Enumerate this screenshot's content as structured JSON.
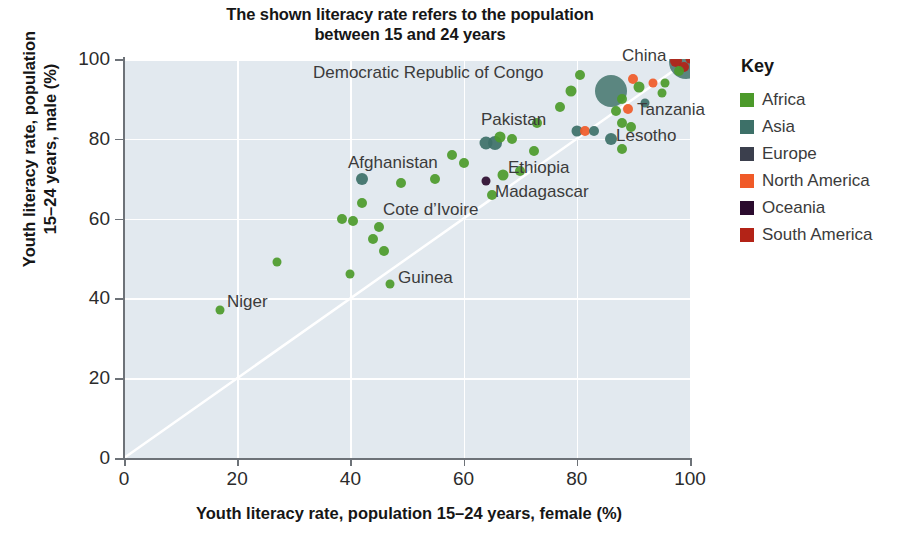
{
  "title": {
    "line1": "The shown literacy rate refers to the population",
    "line2": "between 15 and 24 years"
  },
  "axes": {
    "y_title_line1": "Youth literacy rate, population",
    "y_title_line2": "15–24 years, male (%)",
    "x_title": "Youth literacy rate, population 15–24 years, female (%)",
    "x_ticks": [
      "0",
      "20",
      "40",
      "60",
      "80",
      "100"
    ],
    "y_ticks": [
      "0",
      "20",
      "40",
      "60",
      "80",
      "100"
    ]
  },
  "legend": {
    "title": "Key",
    "items": [
      {
        "label": "Africa",
        "color": "#4c9a2a"
      },
      {
        "label": "Asia",
        "color": "#3d7068"
      },
      {
        "label": "Europe",
        "color": "#3b3f4d"
      },
      {
        "label": "North America",
        "color": "#f05a28"
      },
      {
        "label": "Oceania",
        "color": "#2b0b2e"
      },
      {
        "label": "South America",
        "color": "#b32317"
      }
    ]
  },
  "annotations": [
    {
      "text": "Democratic Republic of Congo",
      "x": 313,
      "y": 63
    },
    {
      "text": "China",
      "x": 622,
      "y": 46
    },
    {
      "text": "Tanzania",
      "x": 637,
      "y": 100
    },
    {
      "text": "Lesotho",
      "x": 616,
      "y": 126
    },
    {
      "text": "Pakistan",
      "x": 481,
      "y": 110
    },
    {
      "text": "Afghanistan",
      "x": 348,
      "y": 153
    },
    {
      "text": "Ethiopia",
      "x": 508,
      "y": 158
    },
    {
      "text": "Madagascar",
      "x": 495,
      "y": 182
    },
    {
      "text": "Cote d’Ivoire",
      "x": 383,
      "y": 200
    },
    {
      "text": "Guinea",
      "x": 398,
      "y": 268
    },
    {
      "text": "Niger",
      "x": 227,
      "y": 292
    }
  ],
  "chart_data": {
    "type": "scatter",
    "title": "The shown literacy rate refers to the population between 15 and 24 years",
    "xlabel": "Youth literacy rate, population 15–24 years, female (%)",
    "ylabel": "Youth literacy rate, population 15–24 years, male (%)",
    "xlim": [
      0,
      100
    ],
    "ylim": [
      0,
      100
    ],
    "xticks": [
      0,
      20,
      40,
      60,
      80,
      100
    ],
    "yticks": [
      0,
      20,
      40,
      60,
      80,
      100
    ],
    "grid": true,
    "legend_position": "right",
    "reference_line": {
      "type": "identity",
      "label": "y = x",
      "color": "#ffffff"
    },
    "size_encoding": "population",
    "series": [
      {
        "name": "Africa",
        "color": "#4c9a2a"
      },
      {
        "name": "Asia",
        "color": "#3d7068"
      },
      {
        "name": "Europe",
        "color": "#3b3f4d"
      },
      {
        "name": "North America",
        "color": "#f05a28"
      },
      {
        "name": "Oceania",
        "color": "#2b0b2e"
      },
      {
        "name": "South America",
        "color": "#b32317"
      }
    ],
    "points": [
      {
        "label": "Niger",
        "x": 17,
        "y": 37,
        "region": "Africa",
        "r": 4.5
      },
      {
        "label": "",
        "x": 27,
        "y": 49,
        "region": "Africa",
        "r": 4.5
      },
      {
        "label": "Guinea",
        "x": 47,
        "y": 43.5,
        "region": "Africa",
        "r": 4.5
      },
      {
        "label": "",
        "x": 40,
        "y": 46,
        "region": "Africa",
        "r": 4.5
      },
      {
        "label": "",
        "x": 46,
        "y": 52,
        "region": "Africa",
        "r": 5
      },
      {
        "label": "",
        "x": 44,
        "y": 55,
        "region": "Africa",
        "r": 5
      },
      {
        "label": "",
        "x": 38.5,
        "y": 60,
        "region": "Africa",
        "r": 5
      },
      {
        "label": "",
        "x": 40.5,
        "y": 59.5,
        "region": "Africa",
        "r": 5
      },
      {
        "label": "Cote d’Ivoire",
        "x": 45,
        "y": 58,
        "region": "Africa",
        "r": 5
      },
      {
        "label": "",
        "x": 42,
        "y": 64,
        "region": "Africa",
        "r": 5
      },
      {
        "label": "Afghanistan",
        "x": 42,
        "y": 70,
        "region": "Asia",
        "r": 6
      },
      {
        "label": "",
        "x": 49,
        "y": 69,
        "region": "Africa",
        "r": 5
      },
      {
        "label": "",
        "x": 55,
        "y": 70,
        "region": "Africa",
        "r": 5
      },
      {
        "label": "",
        "x": 58,
        "y": 76,
        "region": "Africa",
        "r": 5
      },
      {
        "label": "",
        "x": 60,
        "y": 74,
        "region": "Africa",
        "r": 5
      },
      {
        "label": "Papua New Guinea",
        "x": 64,
        "y": 69.5,
        "region": "Oceania",
        "r": 4.5
      },
      {
        "label": "Madagascar",
        "x": 65,
        "y": 66,
        "region": "Africa",
        "r": 5
      },
      {
        "label": "Ethiopia",
        "x": 67,
        "y": 71,
        "region": "Africa",
        "r": 5.5
      },
      {
        "label": "",
        "x": 70,
        "y": 72,
        "region": "Africa",
        "r": 5
      },
      {
        "label": "",
        "x": 64,
        "y": 79,
        "region": "Asia",
        "r": 6.5
      },
      {
        "label": "Pakistan",
        "x": 65.5,
        "y": 79,
        "region": "Asia",
        "r": 7
      },
      {
        "label": "",
        "x": 66.5,
        "y": 80.5,
        "region": "Africa",
        "r": 5.5
      },
      {
        "label": "",
        "x": 68.5,
        "y": 80,
        "region": "Africa",
        "r": 5
      },
      {
        "label": "",
        "x": 72.5,
        "y": 77,
        "region": "Africa",
        "r": 5
      },
      {
        "label": "",
        "x": 73,
        "y": 84,
        "region": "Africa",
        "r": 5
      },
      {
        "label": "",
        "x": 77,
        "y": 88,
        "region": "Africa",
        "r": 5
      },
      {
        "label": "",
        "x": 79,
        "y": 92,
        "region": "Africa",
        "r": 5.5
      },
      {
        "label": "Democratic Republic of Congo",
        "x": 80.5,
        "y": 96,
        "region": "Africa",
        "r": 5
      },
      {
        "label": "",
        "x": 80,
        "y": 82,
        "region": "Asia",
        "r": 5.5
      },
      {
        "label": "",
        "x": 81.5,
        "y": 82,
        "region": "North America",
        "r": 5
      },
      {
        "label": "",
        "x": 83,
        "y": 82,
        "region": "Asia",
        "r": 5
      },
      {
        "label": "Lesotho",
        "x": 86,
        "y": 80,
        "region": "Asia",
        "r": 6
      },
      {
        "label": "",
        "x": 88,
        "y": 77.5,
        "region": "Africa",
        "r": 5
      },
      {
        "label": "India",
        "x": 86,
        "y": 92,
        "region": "Asia",
        "r": 16
      },
      {
        "label": "Tanzania",
        "x": 89,
        "y": 87.5,
        "region": "North America",
        "r": 5
      },
      {
        "label": "",
        "x": 87,
        "y": 87,
        "region": "Africa",
        "r": 5
      },
      {
        "label": "",
        "x": 88,
        "y": 84,
        "region": "Africa",
        "r": 5
      },
      {
        "label": "",
        "x": 89.5,
        "y": 83,
        "region": "Africa",
        "r": 5
      },
      {
        "label": "",
        "x": 88,
        "y": 90,
        "region": "Africa",
        "r": 5
      },
      {
        "label": "",
        "x": 90,
        "y": 95,
        "region": "North America",
        "r": 5
      },
      {
        "label": "",
        "x": 91,
        "y": 93,
        "region": "Africa",
        "r": 5.5
      },
      {
        "label": "",
        "x": 92,
        "y": 89,
        "region": "Asia",
        "r": 4.5
      },
      {
        "label": "",
        "x": 93.5,
        "y": 94,
        "region": "North America",
        "r": 4.5
      },
      {
        "label": "",
        "x": 95.5,
        "y": 94,
        "region": "Africa",
        "r": 4.5
      },
      {
        "label": "",
        "x": 95,
        "y": 91.5,
        "region": "Africa",
        "r": 4.5
      },
      {
        "label": "China",
        "x": 99.3,
        "y": 99.3,
        "region": "Asia",
        "r": 17
      },
      {
        "label": "",
        "x": 97.5,
        "y": 99.5,
        "region": "South America",
        "r": 6
      },
      {
        "label": "",
        "x": 99,
        "y": 98,
        "region": "South America",
        "r": 5
      },
      {
        "label": "",
        "x": 98,
        "y": 97,
        "region": "Africa",
        "r": 5
      },
      {
        "label": "",
        "x": 100,
        "y": 100,
        "region": "South America",
        "r": 4.5
      }
    ]
  }
}
